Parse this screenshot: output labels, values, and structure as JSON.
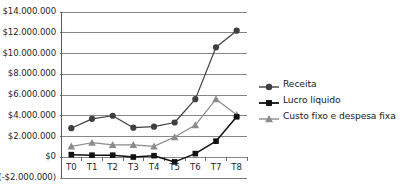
{
  "chart_data": {
    "type": "line",
    "title": "",
    "subtitle": "",
    "xlabel": "",
    "ylabel": "",
    "categories": [
      "T0",
      "T1",
      "T2",
      "T3",
      "T4",
      "T5",
      "T6",
      "T7",
      "T8"
    ],
    "ylim": [
      -2000000,
      14000000
    ],
    "ytick_values": [
      14000000,
      12000000,
      10000000,
      8000000,
      6000000,
      4000000,
      2000000,
      0,
      -2000000
    ],
    "ytick_labels": [
      "$14.000.000",
      "$12.000.000",
      "$10.000.000",
      "$8.000.000",
      "$6.000.000",
      "$4.000.000",
      "$2.000.000",
      "$0",
      "(-$2.000.000)"
    ],
    "grid": true,
    "grid_axis": "y",
    "legend_position": "right",
    "series": [
      {
        "name": "Receita",
        "marker": "circle",
        "color": "#3f3f3f",
        "values": [
          2800000,
          3700000,
          4000000,
          2850000,
          2950000,
          3350000,
          5600000,
          10600000,
          12200000
        ]
      },
      {
        "name": "Lucro líquido",
        "marker": "square",
        "color": "#111111",
        "values": [
          250000,
          200000,
          200000,
          20000,
          150000,
          -450000,
          350000,
          1550000,
          3900000
        ]
      },
      {
        "name": "Custo fixo e despesa fixa",
        "marker": "triangle",
        "color": "#8c8c8c",
        "values": [
          1050000,
          1400000,
          1200000,
          1200000,
          1050000,
          1950000,
          3100000,
          5600000,
          4100000
        ]
      }
    ]
  },
  "legend": {
    "items": [
      {
        "label": "Receita"
      },
      {
        "label": "Lucro líquido"
      },
      {
        "label": "Custo fixo e despesa fixa"
      }
    ]
  },
  "axis_colors": {
    "grid": "#7a7a7a",
    "axis": "#5a5a5a"
  }
}
